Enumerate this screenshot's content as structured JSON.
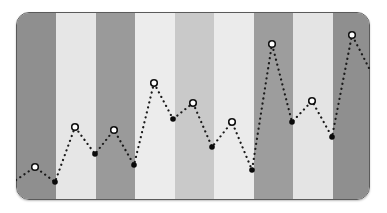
{
  "illustration": {
    "description": "Decorative zig-zag dotted line chart over vertical gray stripes",
    "panel": {
      "x": 16,
      "y": 12,
      "width": 354,
      "height": 188,
      "radius": 13,
      "border_color": "#5a5a5a"
    },
    "stripes": [
      {
        "width": 39,
        "color": "#8f8f8f"
      },
      {
        "width": 40,
        "color": "#e6e6e6"
      },
      {
        "width": 39,
        "color": "#9a9a9a"
      },
      {
        "width": 40,
        "color": "#ececec"
      },
      {
        "width": 39,
        "color": "#c9c9c9"
      },
      {
        "width": 40,
        "color": "#ebebeb"
      },
      {
        "width": 39,
        "color": "#9d9d9d"
      },
      {
        "width": 40,
        "color": "#e4e4e4"
      },
      {
        "width": 38,
        "color": "#8f8f8f"
      }
    ],
    "line": {
      "color": "#1a1a1a",
      "style": "dotted"
    },
    "points": [
      {
        "x": 16,
        "y": 180,
        "marker": "none"
      },
      {
        "x": 35,
        "y": 167,
        "marker": "open"
      },
      {
        "x": 55,
        "y": 182,
        "marker": "filled"
      },
      {
        "x": 75,
        "y": 127,
        "marker": "open"
      },
      {
        "x": 95,
        "y": 154,
        "marker": "filled"
      },
      {
        "x": 114,
        "y": 130,
        "marker": "open"
      },
      {
        "x": 134,
        "y": 165,
        "marker": "filled"
      },
      {
        "x": 154,
        "y": 83,
        "marker": "open"
      },
      {
        "x": 173,
        "y": 119,
        "marker": "filled"
      },
      {
        "x": 193,
        "y": 103,
        "marker": "open"
      },
      {
        "x": 212,
        "y": 147,
        "marker": "filled"
      },
      {
        "x": 232,
        "y": 122,
        "marker": "open"
      },
      {
        "x": 252,
        "y": 170,
        "marker": "filled"
      },
      {
        "x": 272,
        "y": 44,
        "marker": "open"
      },
      {
        "x": 292,
        "y": 122,
        "marker": "filled"
      },
      {
        "x": 312,
        "y": 101,
        "marker": "open"
      },
      {
        "x": 332,
        "y": 137,
        "marker": "filled"
      },
      {
        "x": 352,
        "y": 35,
        "marker": "open"
      },
      {
        "x": 370,
        "y": 70,
        "marker": "none"
      }
    ]
  }
}
